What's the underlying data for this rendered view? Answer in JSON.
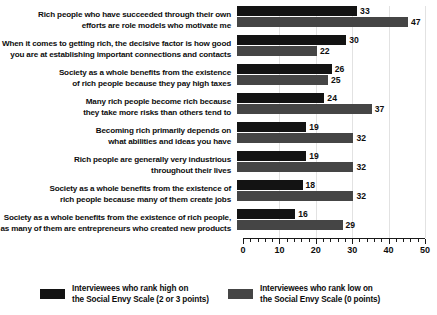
{
  "chart_data": {
    "type": "bar",
    "orientation": "horizontal",
    "title": "",
    "subtitle": "",
    "xlabel": "",
    "ylabel": "",
    "xlim": [
      0,
      50
    ],
    "xticks": [
      0,
      10,
      20,
      30,
      40,
      50
    ],
    "xtick_labels": [
      "0",
      "10",
      "20",
      "30",
      "40",
      "50"
    ],
    "minor_tick_step": 2,
    "grid": true,
    "grid_axis": "x",
    "legend_position": "bottom",
    "categories": [
      "Rich people who have succeeded through their own efforts are role models who motivate me",
      "When it comes to getting rich, the decisive factor is how good you are at establishing important connections and contacts",
      "Society as a whole benefits from the existence of rich people because they pay high taxes",
      "Many rich people become rich because they take more risks than others tend to",
      "Becoming rich primarily depends on what abilities and ideas you have",
      "Rich people are generally very industrious throughout their lives",
      "Society as a whole benefits from the existence of rich people because many of them create jobs",
      "Society as a whole benefits from the existence of rich people, as many of them are entrepreneurs who created new products"
    ],
    "category_lines": [
      [
        "Rich people who have succeeded through their own",
        "efforts are role models who motivate me"
      ],
      [
        "When it comes to getting rich, the decisive factor is how good",
        "you are at establishing important connections and contacts"
      ],
      [
        "Society as a whole benefits from the existence",
        "of rich people because they pay high taxes"
      ],
      [
        "Many rich people become rich because",
        "they take more risks than others tend to"
      ],
      [
        "Becoming rich primarily depends on",
        "what abilities and ideas you have"
      ],
      [
        "Rich people are generally very industrious",
        "throughout their lives"
      ],
      [
        "Society as a whole benefits from the existence of",
        "rich people because many of them create jobs"
      ],
      [
        "Society as a whole benefits from the existence of rich people,",
        "as many of them are entrepreneurs who created new products"
      ]
    ],
    "series": [
      {
        "name": "Interviewees who rank high on the Social Envy Scale (2 or 3 points)",
        "color": "#131313",
        "values": [
          33,
          30,
          26,
          24,
          19,
          19,
          18,
          16
        ]
      },
      {
        "name": "Interviewees who rank low on the Social Envy Scale (0 points)",
        "color": "#454545",
        "values": [
          47,
          22,
          25,
          37,
          32,
          32,
          32,
          29
        ]
      }
    ]
  },
  "legend": {
    "items": [
      {
        "swatch": "high",
        "line1": "Interviewees who rank high on",
        "line2": "the Social Envy Scale (2 or 3 points)"
      },
      {
        "swatch": "low",
        "line1": "Interviewees who rank low on",
        "line2": "the Social Envy Scale (0 points)"
      }
    ]
  },
  "colors": {
    "high": "#131313",
    "low": "#454545",
    "axis": "#1a1a1a",
    "grid": "#e2e2e2",
    "text": "#0d0d0d",
    "background": "#ffffff"
  }
}
